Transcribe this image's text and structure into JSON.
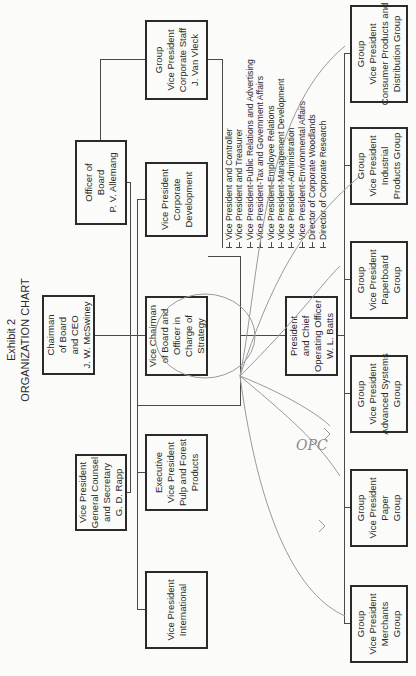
{
  "title": {
    "line1": "Exhibit 2",
    "line2": "ORGANIZATION CHART"
  },
  "boxes": {
    "chairman": [
      "Chairman",
      "of Board",
      "and CEO",
      "J. W. McSwiney"
    ],
    "officer_of_board": [
      "Officer of",
      "Board",
      "P. V. Allemang"
    ],
    "vp_general_counsel": [
      "Vice President",
      "General Counsel",
      "and Secretary",
      "G. D. Rapp"
    ],
    "vp_corporate_development": [
      "Vice President",
      "Corporate",
      "Development"
    ],
    "vice_chairman": [
      "Vice Chairman",
      "of Board and",
      "Officer in",
      "Charge of",
      "Strategy"
    ],
    "evp_pulp_forest": [
      "Executive",
      "Vice President",
      "Pulp and Forest",
      "Products"
    ],
    "vp_international": [
      "Vice President",
      "International"
    ],
    "gvp_corporate_staff": [
      "Group",
      "Vice President",
      "Corporate Staff",
      "J. Van Vleck"
    ],
    "president_coo": [
      "President",
      "and Chief",
      "Operating Officer",
      "W. L. Batts"
    ]
  },
  "staff_list": [
    "Vice President and Controller",
    "Vice President and Treasurer",
    "Vice President-Public Relations and Advertising",
    "Vice President-Tax and Government Affairs",
    "Vice President-Employee Relations",
    "Vice President-Management Development",
    "Vice President-Administration",
    "Vice President-Environmental Affairs",
    "Director of Corporate Woodlands",
    "Director of Corporate Research"
  ],
  "groups": [
    [
      "Group",
      "Vice President",
      "Merchants",
      "Group"
    ],
    [
      "Group",
      "Vice President",
      "Paper",
      "Group"
    ],
    [
      "Group",
      "Vice President",
      "Advanced Systems",
      "Group"
    ],
    [
      "Group",
      "Vice President",
      "Paperboard",
      "Group"
    ],
    [
      "Group",
      "Vice President",
      "Industrial",
      "Products Group"
    ],
    [
      "Group",
      "Vice President",
      "Consumer Products and",
      "Distribution Group"
    ]
  ],
  "annotation": {
    "handwritten_text": "OPC"
  },
  "colors": {
    "ink": "#2a2a2a",
    "pencil": "#9a9a9a",
    "paper": "#fbfbfa"
  }
}
